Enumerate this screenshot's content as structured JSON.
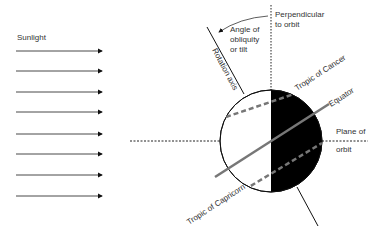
{
  "diagram": {
    "labels": {
      "sunlight": "Sunlight",
      "perpendicular_line1": "Perpendicular",
      "perpendicular_line2": "to orbit",
      "angle_line1": "Angle of",
      "angle_line2": "obliquity",
      "angle_line3": "or tilt",
      "rotation_axis": "Rotation axis",
      "tropic_cancer": "Tropic of Cancer",
      "equator": "Equator",
      "plane_line1": "Plane of",
      "plane_line2": "orbit",
      "tropic_capricorn": "Tropic of Capricorn"
    },
    "sun_rays_count": 8,
    "colors": {
      "night_side": "#000000",
      "day_side": "#ffffff",
      "equator": "#777777",
      "tropics": "#777777",
      "lines": "#111111"
    }
  }
}
